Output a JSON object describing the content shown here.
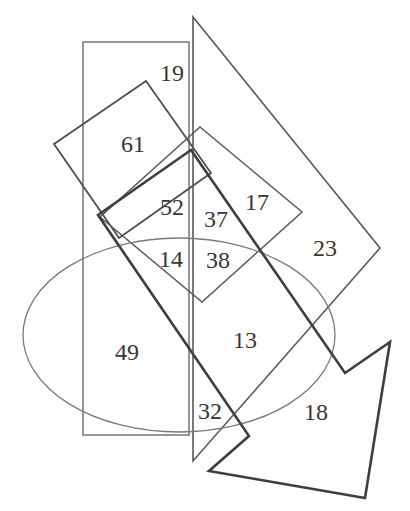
{
  "figure": {
    "kind": "overlapping-shapes counting puzzle",
    "background": "#ffffff"
  },
  "colors": {
    "ink": "#4a4a4a",
    "label_text": "#363636"
  },
  "shapes": [
    {
      "name": "rectangle",
      "stroke": "#6a6a6a"
    },
    {
      "name": "rotated-square-large",
      "stroke": "#4e4e4e"
    },
    {
      "name": "rotated-square-small",
      "stroke": "#5a5a5a"
    },
    {
      "name": "triangle",
      "stroke": "#585858"
    },
    {
      "name": "ellipse",
      "stroke": "#7a7a7a"
    },
    {
      "name": "block-arrow",
      "stroke": "#3e3e3e"
    }
  ],
  "region_labels": [
    {
      "value": "19"
    },
    {
      "value": "61"
    },
    {
      "value": "52"
    },
    {
      "value": "37"
    },
    {
      "value": "17"
    },
    {
      "value": "23"
    },
    {
      "value": "14"
    },
    {
      "value": "38"
    },
    {
      "value": "13"
    },
    {
      "value": "49"
    },
    {
      "value": "32"
    },
    {
      "value": "18"
    }
  ]
}
